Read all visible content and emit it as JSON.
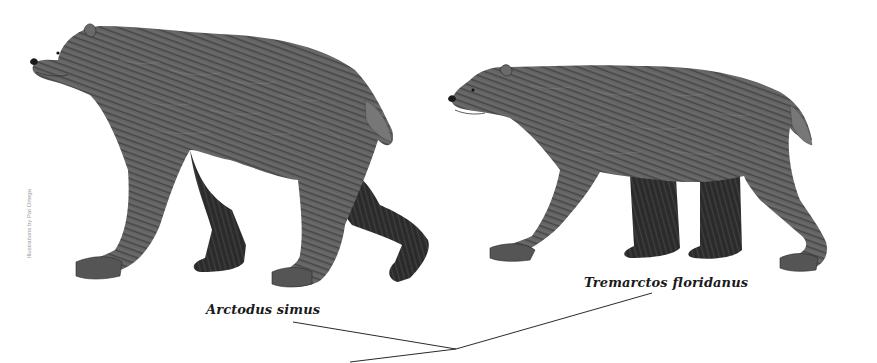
{
  "figure": {
    "background_color": "#ffffff",
    "credit": "Illustrations by Pat Ortega",
    "animals": [
      {
        "id": "arctodus",
        "label": "Arctodus simus",
        "description": "Short-faced bear illustration, left"
      },
      {
        "id": "tremarctos",
        "label": "Tremarctos floridanus",
        "description": "Florida spectacled bear illustration, right"
      }
    ],
    "leader_lines": {
      "junction": [
        456,
        349
      ],
      "segments": [
        {
          "from": [
            293,
            322
          ],
          "to": [
            456,
            349
          ]
        },
        {
          "from": [
            456,
            349
          ],
          "to": [
            652,
            293
          ]
        },
        {
          "from": [
            456,
            349
          ],
          "to": [
            350,
            362
          ]
        }
      ]
    },
    "colors": {
      "fur_dark": "#2e2e2e",
      "fur_mid": "#5a5a5a",
      "fur_light": "#8c8c8c",
      "text": "#1a1a1a",
      "credit_text": "#9a9a9a"
    }
  }
}
